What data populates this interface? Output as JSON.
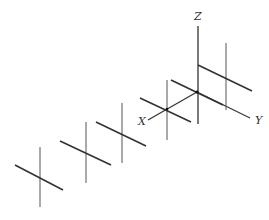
{
  "diagram": {
    "title": "",
    "axes": {
      "x_label": "X",
      "y_label": "Y",
      "z_label": "Z"
    },
    "elements": [
      {
        "name": "element-1",
        "kind": "crossed-dipole"
      },
      {
        "name": "element-2",
        "kind": "crossed-dipole"
      },
      {
        "name": "element-3",
        "kind": "crossed-dipole"
      },
      {
        "name": "element-4",
        "kind": "crossed-dipole"
      },
      {
        "name": "element-5",
        "kind": "crossed-dipole"
      },
      {
        "name": "element-6",
        "kind": "crossed-dipole"
      }
    ],
    "colors": {
      "line": "#3a3a3a",
      "axis": "#222222"
    }
  }
}
